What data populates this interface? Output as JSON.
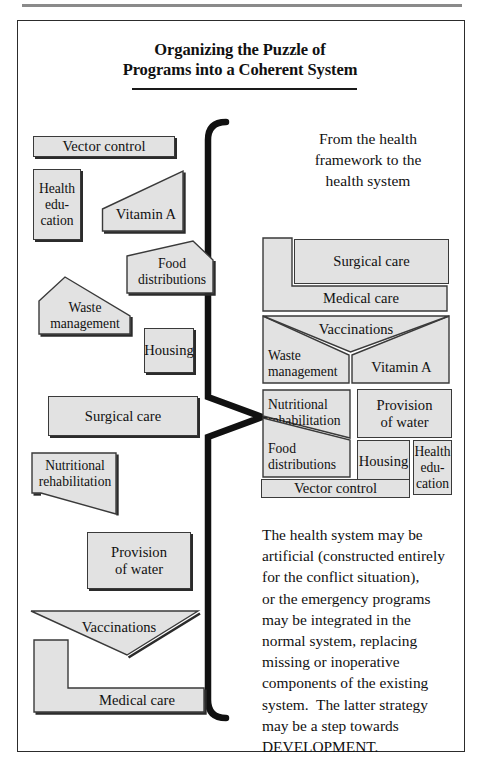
{
  "document": {
    "title_line1": "Organizing the Puzzle of",
    "title_line2": "Programs into a Coherent System",
    "caption_line1": "From the health",
    "caption_line2": "framework to the",
    "caption_line3": "health system"
  },
  "body_paragraph": {
    "lines": [
      "The health system may be",
      "artificial (constructed entirely",
      "for the conflict situation),",
      "or the emergency programs",
      "may be integrated in the",
      "normal system, replacing",
      "missing or inoperative",
      "components of the existing",
      "system.  The latter strategy",
      "may be a step towards",
      "DEVELOPMENT."
    ]
  },
  "scattered_pieces": [
    {
      "id": "vector-control",
      "label": "Vector control",
      "shape": "rectangle"
    },
    {
      "id": "health-education",
      "label": "Health\nedu-\ncation",
      "shape": "rectangle"
    },
    {
      "id": "vitamin-a",
      "label": "Vitamin A",
      "shape": "right-triangle-wedge"
    },
    {
      "id": "food-distributions",
      "label": "Food\ndistributions",
      "shape": "slanted-quad"
    },
    {
      "id": "waste-management",
      "label": "Waste\nmanagement",
      "shape": "slanted-quad"
    },
    {
      "id": "housing",
      "label": "Housing",
      "shape": "rectangle"
    },
    {
      "id": "surgical-care",
      "label": "Surgical care",
      "shape": "rectangle"
    },
    {
      "id": "nutritional-rehab",
      "label": "Nutritional\nrehabilitation",
      "shape": "slanted-quad"
    },
    {
      "id": "provision-of-water",
      "label": "Provision\nof water",
      "shape": "rectangle"
    },
    {
      "id": "vaccinations",
      "label": "Vaccinations",
      "shape": "v-chevron"
    },
    {
      "id": "medical-care",
      "label": "Medical care",
      "shape": "l-shape"
    }
  ],
  "scattered_labels": {
    "vector_control": "Vector control",
    "health_education_l1": "Health",
    "health_education_l2": "edu-",
    "health_education_l3": "cation",
    "vitamin_a": "Vitamin A",
    "food_distributions_l1": "Food",
    "food_distributions_l2": "distributions",
    "waste_management_l1": "Waste",
    "waste_management_l2": "management",
    "housing": "Housing",
    "surgical_care": "Surgical care",
    "nutritional_rehab_l1": "Nutritional",
    "nutritional_rehab_l2": "rehabilitation",
    "provision_of_water_l1": "Provision",
    "provision_of_water_l2": "of water",
    "vaccinations": "Vaccinations",
    "medical_care": "Medical care"
  },
  "assembled_system": {
    "surgical_care": "Surgical care",
    "medical_care": "Medical care",
    "vaccinations": "Vaccinations",
    "waste_management_l1": "Waste",
    "waste_management_l2": "management",
    "vitamin_a": "Vitamin A",
    "nutritional_rehab_l1": "Nutritional",
    "nutritional_rehab_l2": "rehabilitation",
    "provision_of_water_l1": "Provision",
    "provision_of_water_l2": "of water",
    "food_distributions_l1": "Food",
    "food_distributions_l2": "distributions",
    "housing": "Housing",
    "health_education_l1": "Health",
    "health_education_l2": "edu-",
    "health_education_l3": "cation",
    "vector_control": "Vector control"
  },
  "colors": {
    "piece_fill": "#e2e2e2",
    "piece_stroke": "#3a3a3a",
    "shadow": "#2b2b2b",
    "frame": "#2c2c2c",
    "text": "#111111",
    "rule": "#8a8a8a"
  }
}
